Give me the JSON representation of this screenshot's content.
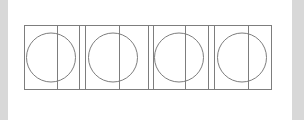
{
  "canvas": {
    "width": 304,
    "height": 120,
    "background_color": "#d8d8d8",
    "paper_color": "#ffffff",
    "paper": {
      "x": 8,
      "y": 0,
      "width": 284,
      "height": 120
    }
  },
  "figure": {
    "stroke_color": "#7d7d7d",
    "stroke_width": 1,
    "fill": "none",
    "outer_rect": {
      "x": 24,
      "y": 25,
      "width": 248,
      "height": 65
    },
    "panel_count": 4,
    "panel_width": 59.5,
    "panel_gap": 5.5,
    "circle": {
      "diameter": 49,
      "radius": 24.5,
      "center_y": 57.5
    },
    "divider_offset_ratio": 0.55,
    "panels": [
      {
        "index": 1,
        "name": "panel-1",
        "rect": {
          "x": 24,
          "y": 25,
          "width": 55,
          "height": 65
        },
        "circle": {
          "cx": 51,
          "cy": 57.5,
          "r": 24.5
        },
        "divider_x": 57
      },
      {
        "index": 2,
        "name": "panel-2",
        "rect": {
          "x": 85,
          "y": 25,
          "width": 63,
          "height": 65
        },
        "circle": {
          "cx": 113,
          "cy": 57.5,
          "r": 24.5
        },
        "divider_x": 119
      },
      {
        "index": 3,
        "name": "panel-3",
        "rect": {
          "x": 153,
          "y": 25,
          "width": 55,
          "height": 65
        },
        "circle": {
          "cx": 179,
          "cy": 57.5,
          "r": 24.5
        },
        "divider_x": 185
      },
      {
        "index": 4,
        "name": "panel-4",
        "rect": {
          "x": 214,
          "y": 25,
          "width": 58,
          "height": 65
        },
        "circle": {
          "cx": 242,
          "cy": 57.5,
          "r": 24.5
        },
        "divider_x": 248
      }
    ],
    "separator_lines_x": [
      79,
      85,
      148,
      153,
      208,
      214
    ]
  }
}
